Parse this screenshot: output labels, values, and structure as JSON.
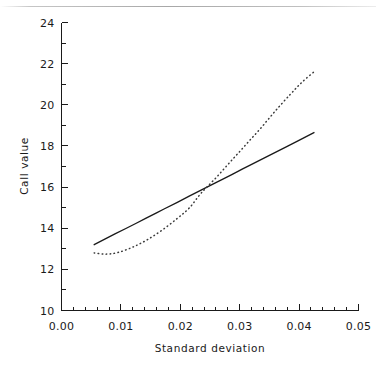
{
  "chart_data": {
    "type": "line",
    "title": "",
    "xlabel": "Standard deviation",
    "ylabel": "Call value",
    "xlim": [
      0.0,
      0.05
    ],
    "ylim": [
      10,
      24
    ],
    "xticks": [
      0.0,
      0.01,
      0.02,
      0.03,
      0.04,
      0.05
    ],
    "xticklabels": [
      "0.00",
      "0.01",
      "0.02",
      "0.03",
      "0.04",
      "0.05"
    ],
    "yticks": [
      10,
      12,
      14,
      16,
      18,
      20,
      22,
      24
    ],
    "yticklabels": [
      "10",
      "12",
      "14",
      "16",
      "18",
      "20",
      "22",
      "24"
    ],
    "x_minor_per_major": 5,
    "y_minor_per_major": 2,
    "grid": false,
    "legend": "none",
    "series": [
      {
        "name": "solid-line",
        "style": "solid",
        "color": "#1a1a1a",
        "x": [
          0.0055,
          0.009,
          0.0125,
          0.016,
          0.0195,
          0.0235,
          0.027,
          0.0305,
          0.034,
          0.038,
          0.0425
        ],
        "y": [
          13.2,
          13.72,
          14.23,
          14.75,
          15.26,
          15.85,
          16.36,
          16.88,
          17.39,
          17.98,
          18.65
        ]
      },
      {
        "name": "dotted-curve",
        "style": "dotted",
        "color": "#3a3a3a",
        "x": [
          0.0055,
          0.0075,
          0.0095,
          0.012,
          0.0145,
          0.017,
          0.0195,
          0.0215,
          0.0235,
          0.026,
          0.0285,
          0.031,
          0.0335,
          0.036,
          0.0385,
          0.0405,
          0.0425
        ],
        "y": [
          12.8,
          12.74,
          12.82,
          13.08,
          13.45,
          13.92,
          14.48,
          14.98,
          15.7,
          16.45,
          17.25,
          18.05,
          18.85,
          19.7,
          20.5,
          21.1,
          21.6
        ]
      }
    ]
  },
  "axis_labels": {
    "x_title": "Standard deviation",
    "y_title": "Call value"
  }
}
